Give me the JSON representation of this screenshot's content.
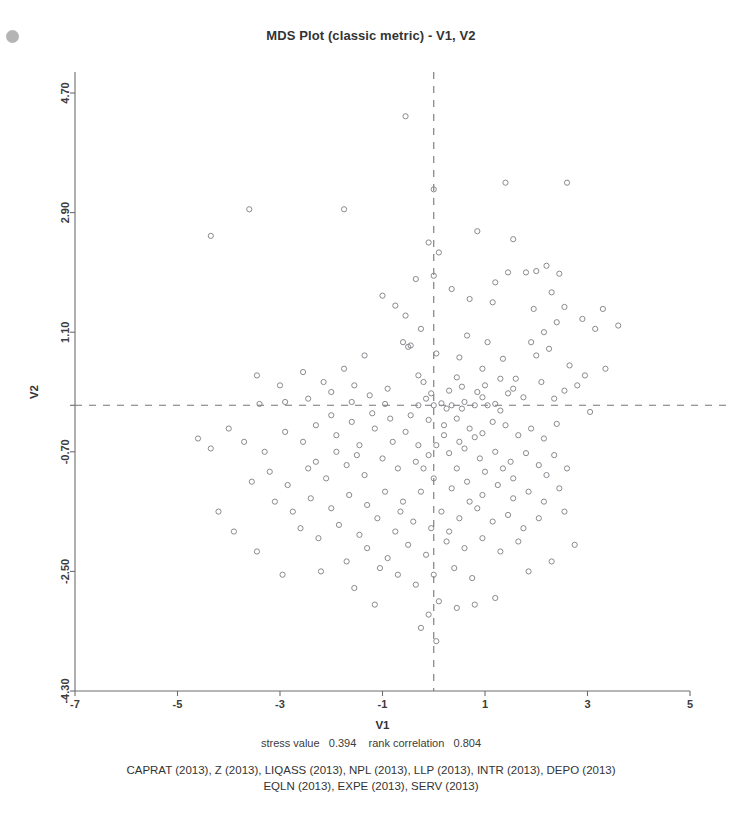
{
  "chart_data": {
    "type": "scatter",
    "title": "MDS Plot (classic metric) - V1, V2",
    "xlabel": "V1",
    "ylabel": "V2",
    "xlim": [
      -7,
      5
    ],
    "ylim": [
      -4.3,
      4.7
    ],
    "xticks": [
      -7,
      -5,
      -3,
      -1,
      1,
      3,
      5
    ],
    "xticklabels": [
      "-7",
      "-5",
      "-3",
      "-1",
      "1",
      "3",
      "5"
    ],
    "yticks": [
      4.7,
      2.9,
      1.1,
      -0.7,
      -2.5,
      -4.3
    ],
    "yticklabels": [
      "4.70",
      "2.90",
      "1.10",
      "-0.70",
      "-2.50",
      "-4.30"
    ],
    "grid": false,
    "legend": "none",
    "reference_lines": {
      "vertical_x": 0,
      "horizontal_y": 0,
      "style": "dashed"
    },
    "marker": {
      "shape": "open-circle",
      "radius_px": 2.6,
      "color": "#8a8a90"
    },
    "points": [
      [
        -0.55,
        4.35
      ],
      [
        1.4,
        3.35
      ],
      [
        2.6,
        3.35
      ],
      [
        -3.6,
        2.95
      ],
      [
        -1.75,
        2.95
      ],
      [
        0.0,
        3.25
      ],
      [
        -4.35,
        2.55
      ],
      [
        0.85,
        2.62
      ],
      [
        -0.1,
        2.45
      ],
      [
        1.55,
        2.5
      ],
      [
        2.0,
        2.02
      ],
      [
        2.2,
        2.1
      ],
      [
        1.45,
        2.0
      ],
      [
        1.8,
        2.0
      ],
      [
        2.45,
        1.98
      ],
      [
        0.0,
        1.95
      ],
      [
        2.3,
        1.7
      ],
      [
        -1.0,
        1.65
      ],
      [
        1.95,
        1.45
      ],
      [
        2.55,
        1.48
      ],
      [
        2.4,
        1.25
      ],
      [
        -0.35,
        1.9
      ],
      [
        2.15,
        1.1
      ],
      [
        -0.6,
        0.95
      ],
      [
        -0.5,
        0.88
      ],
      [
        -0.45,
        0.9
      ],
      [
        0.05,
        0.78
      ],
      [
        0.5,
        0.72
      ],
      [
        1.35,
        0.7
      ],
      [
        2.0,
        0.75
      ],
      [
        1.15,
        1.55
      ],
      [
        2.9,
        1.3
      ],
      [
        3.15,
        1.15
      ],
      [
        3.3,
        1.45
      ],
      [
        3.6,
        1.2
      ],
      [
        -0.3,
        0.45
      ],
      [
        0.45,
        0.42
      ],
      [
        0.95,
        0.55
      ],
      [
        1.3,
        0.4
      ],
      [
        1.55,
        0.25
      ],
      [
        -0.2,
        0.35
      ],
      [
        -2.9,
        0.05
      ],
      [
        -3.4,
        0.02
      ],
      [
        -1.6,
        0.05
      ],
      [
        -0.95,
        0.02
      ],
      [
        -0.3,
        0.0
      ],
      [
        0.0,
        0.0
      ],
      [
        0.15,
        0.03
      ],
      [
        0.35,
        0.0
      ],
      [
        0.6,
        0.05
      ],
      [
        0.8,
        0.0
      ],
      [
        1.05,
        0.0
      ],
      [
        1.2,
        0.02
      ],
      [
        0.25,
        -0.05
      ],
      [
        -0.15,
        0.1
      ],
      [
        -0.05,
        0.18
      ],
      [
        0.3,
        0.22
      ],
      [
        0.55,
        0.28
      ],
      [
        0.85,
        0.2
      ],
      [
        1.0,
        0.3
      ],
      [
        1.45,
        0.18
      ],
      [
        1.75,
        0.12
      ],
      [
        2.1,
        0.35
      ],
      [
        2.35,
        0.1
      ],
      [
        2.55,
        0.22
      ],
      [
        3.05,
        -0.1
      ],
      [
        -0.1,
        -0.22
      ],
      [
        0.2,
        -0.3
      ],
      [
        0.45,
        -0.2
      ],
      [
        0.7,
        -0.35
      ],
      [
        0.95,
        -0.42
      ],
      [
        1.15,
        -0.25
      ],
      [
        1.4,
        -0.3
      ],
      [
        1.65,
        -0.45
      ],
      [
        1.9,
        -0.35
      ],
      [
        2.15,
        -0.5
      ],
      [
        2.4,
        -0.28
      ],
      [
        -0.55,
        -0.4
      ],
      [
        -0.8,
        -0.55
      ],
      [
        -1.15,
        -0.35
      ],
      [
        -1.45,
        -0.6
      ],
      [
        -1.9,
        -0.45
      ],
      [
        -2.3,
        -0.3
      ],
      [
        -2.55,
        -0.55
      ],
      [
        -2.9,
        -0.4
      ],
      [
        -3.3,
        -0.7
      ],
      [
        -3.7,
        -0.55
      ],
      [
        -4.0,
        -0.35
      ],
      [
        -4.35,
        -0.65
      ],
      [
        -4.6,
        -0.5
      ],
      [
        0.05,
        -0.6
      ],
      [
        0.3,
        -0.72
      ],
      [
        0.6,
        -0.65
      ],
      [
        0.9,
        -0.8
      ],
      [
        1.2,
        -0.7
      ],
      [
        1.5,
        -0.85
      ],
      [
        1.8,
        -0.72
      ],
      [
        2.05,
        -0.9
      ],
      [
        2.35,
        -0.75
      ],
      [
        2.6,
        -0.95
      ],
      [
        -0.35,
        -0.85
      ],
      [
        -0.7,
        -0.95
      ],
      [
        -1.0,
        -0.8
      ],
      [
        -1.35,
        -1.05
      ],
      [
        -1.7,
        -0.9
      ],
      [
        -2.1,
        -1.1
      ],
      [
        -2.45,
        -0.95
      ],
      [
        -2.85,
        -1.2
      ],
      [
        -3.2,
        -1.0
      ],
      [
        -3.55,
        -1.15
      ],
      [
        0.0,
        -1.1
      ],
      [
        0.35,
        -1.25
      ],
      [
        0.65,
        -1.15
      ],
      [
        0.95,
        -1.35
      ],
      [
        1.25,
        -1.2
      ],
      [
        1.55,
        -1.4
      ],
      [
        1.85,
        -1.3
      ],
      [
        2.15,
        -1.45
      ],
      [
        2.45,
        -1.25
      ],
      [
        -0.25,
        -1.3
      ],
      [
        -0.6,
        -1.45
      ],
      [
        -0.95,
        -1.3
      ],
      [
        -1.3,
        -1.5
      ],
      [
        -1.65,
        -1.35
      ],
      [
        -2.0,
        -1.55
      ],
      [
        -2.4,
        -1.4
      ],
      [
        -2.75,
        -1.6
      ],
      [
        -3.1,
        -1.45
      ],
      [
        0.15,
        -1.6
      ],
      [
        0.5,
        -1.7
      ],
      [
        0.85,
        -1.55
      ],
      [
        1.15,
        -1.75
      ],
      [
        1.45,
        -1.65
      ],
      [
        1.75,
        -1.85
      ],
      [
        2.05,
        -1.7
      ],
      [
        -0.4,
        -1.75
      ],
      [
        -0.75,
        -1.9
      ],
      [
        -1.1,
        -1.7
      ],
      [
        -1.45,
        -1.95
      ],
      [
        -1.85,
        -1.8
      ],
      [
        -2.25,
        -2.0
      ],
      [
        -2.6,
        -1.85
      ],
      [
        0.25,
        -2.05
      ],
      [
        0.6,
        -2.15
      ],
      [
        0.95,
        -2.0
      ],
      [
        1.3,
        -2.2
      ],
      [
        1.65,
        -2.05
      ],
      [
        -0.15,
        -2.25
      ],
      [
        -0.5,
        -2.1
      ],
      [
        -0.9,
        -2.3
      ],
      [
        -1.3,
        -2.15
      ],
      [
        -1.7,
        -2.35
      ],
      [
        -2.2,
        -2.5
      ],
      [
        0.0,
        -2.55
      ],
      [
        0.4,
        -2.45
      ],
      [
        0.75,
        -2.6
      ],
      [
        -0.35,
        -2.7
      ],
      [
        -0.7,
        -2.55
      ],
      [
        0.1,
        -2.95
      ],
      [
        0.45,
        -3.05
      ],
      [
        0.8,
        -3.0
      ],
      [
        1.2,
        -2.9
      ],
      [
        -0.1,
        -3.15
      ],
      [
        0.05,
        -3.55
      ],
      [
        -0.25,
        -3.35
      ],
      [
        1.85,
        -2.5
      ],
      [
        2.3,
        -2.35
      ],
      [
        2.75,
        -2.1
      ],
      [
        -3.9,
        -1.9
      ],
      [
        -4.2,
        -1.6
      ],
      [
        -3.45,
        -2.2
      ],
      [
        -2.95,
        -2.55
      ],
      [
        -1.15,
        -3.0
      ],
      [
        -1.55,
        -2.75
      ],
      [
        -0.55,
        1.35
      ],
      [
        -0.25,
        1.15
      ],
      [
        0.65,
        1.05
      ],
      [
        1.05,
        0.95
      ],
      [
        -1.35,
        0.75
      ],
      [
        -1.75,
        0.55
      ],
      [
        -2.15,
        0.35
      ],
      [
        -2.55,
        0.5
      ],
      [
        -3.0,
        0.3
      ],
      [
        -3.45,
        0.45
      ],
      [
        -0.9,
        0.25
      ],
      [
        -1.25,
        0.15
      ],
      [
        -1.55,
        0.3
      ],
      [
        -2.0,
        0.2
      ],
      [
        -2.45,
        0.1
      ],
      [
        0.1,
        2.3
      ],
      [
        0.35,
        1.75
      ],
      [
        0.7,
        1.6
      ],
      [
        1.2,
        1.85
      ],
      [
        -0.75,
        1.5
      ],
      [
        1.9,
        0.95
      ],
      [
        2.25,
        0.85
      ],
      [
        2.65,
        0.6
      ],
      [
        2.95,
        0.45
      ],
      [
        3.35,
        0.55
      ],
      [
        0.55,
        -0.05
      ],
      [
        0.95,
        0.12
      ],
      [
        1.3,
        -0.08
      ],
      [
        1.6,
        0.4
      ],
      [
        2.8,
        0.3
      ],
      [
        -0.45,
        -0.15
      ],
      [
        -0.85,
        -0.2
      ],
      [
        -1.2,
        -0.12
      ],
      [
        -1.6,
        -0.25
      ],
      [
        -2.0,
        -0.15
      ],
      [
        0.2,
        -0.45
      ],
      [
        0.5,
        -0.55
      ],
      [
        0.8,
        -0.48
      ],
      [
        -0.1,
        -0.75
      ],
      [
        -0.3,
        -0.6
      ],
      [
        1.0,
        -1.0
      ],
      [
        1.35,
        -0.95
      ],
      [
        -1.5,
        -0.75
      ],
      [
        -1.9,
        -0.7
      ],
      [
        -2.3,
        -0.85
      ],
      [
        0.7,
        -1.45
      ],
      [
        -0.2,
        -0.95
      ],
      [
        -0.05,
        -1.85
      ],
      [
        0.3,
        -1.9
      ],
      [
        1.55,
        -1.1
      ],
      [
        2.55,
        -1.6
      ],
      [
        2.2,
        -1.05
      ],
      [
        -0.65,
        -1.6
      ],
      [
        -1.05,
        -2.45
      ],
      [
        0.45,
        -0.95
      ]
    ],
    "annotations": {
      "stress_label": "stress value",
      "stress_value": "0.394",
      "rank_label": "rank correlation",
      "rank_value": "0.804",
      "variable_lines": [
        "CAPRAT (2013), Z (2013), LIQASS (2013), NPL (2013), LLP (2013), INTR (2013), DEPO (2013)",
        "EQLN (2013), EXPE (2013), SERV (2013)"
      ]
    }
  }
}
